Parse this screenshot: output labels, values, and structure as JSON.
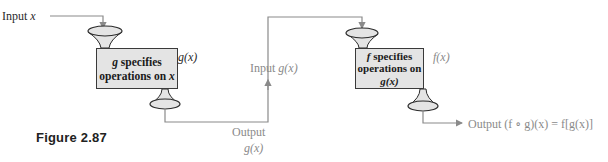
{
  "figure_label": "Figure 2.87",
  "input_x": {
    "text": "Input ",
    "var": "x"
  },
  "box_g": {
    "line1_var": "g",
    "line1_text": " specifies",
    "line2_text": "operations on ",
    "line2_var": "x"
  },
  "g_of_x_label": "g(x)",
  "output_g": {
    "line1": "Output",
    "line2": "g(x)"
  },
  "input_gx": {
    "text": "Input ",
    "var": "g(x)"
  },
  "box_f": {
    "line1_var": "f",
    "line1_text": " specifies",
    "line2_text": "operations on",
    "line3": "g(x)"
  },
  "f_of_x_label": "f(x)",
  "output_final": "Output (f ∘ g)(x) = f[g(x)]",
  "colors": {
    "box_fill": "#e4e4e4",
    "line": "#8a8a8a",
    "dark_text": "#2a2a2a",
    "grey_text": "#8a8a8a"
  }
}
